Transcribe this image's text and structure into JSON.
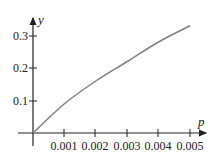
{
  "chart_data": {
    "type": "line",
    "title": "",
    "xlabel": "p",
    "ylabel": "y",
    "x": [
      0,
      0.001,
      0.002,
      0.003,
      0.004,
      0.005
    ],
    "series": [
      {
        "name": "y(p)",
        "values": [
          0,
          0.09,
          0.16,
          0.22,
          0.28,
          0.33
        ],
        "color": "#808080"
      }
    ],
    "xticks": [
      "0.001",
      "0.002",
      "0.003",
      "0.004",
      "0.005"
    ],
    "yticks": [
      "0.1",
      "0.2",
      "0.3"
    ],
    "xlim": [
      0,
      0.0055
    ],
    "ylim": [
      0,
      0.35
    ],
    "grid": false,
    "legend": "none"
  },
  "axis": {
    "x_label": "p",
    "y_label": "y",
    "x_tick_labels": [
      "0.001",
      "0.002",
      "0.003",
      "0.004",
      "0.005"
    ],
    "y_tick_labels": [
      "0.1",
      "0.2",
      "0.3"
    ]
  }
}
